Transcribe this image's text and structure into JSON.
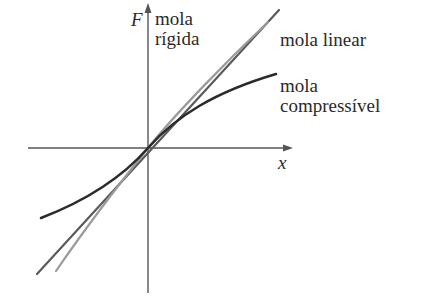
{
  "diagram": {
    "type": "force-vs-displacement",
    "axes": {
      "y_label": "F",
      "x_label": "x"
    },
    "curves": [
      {
        "id": "rigid",
        "label_line1": "mola",
        "label_line2": "rígida",
        "color": "#8c8c8c",
        "shape": "stiffening (cubic-like)"
      },
      {
        "id": "linear",
        "label": "mola linear",
        "color": "#555555",
        "shape": "straight line through origin"
      },
      {
        "id": "compressible",
        "label_line1": "mola",
        "label_line2": "compressível",
        "color": "#2b2b2b",
        "shape": "softening (saturating)"
      }
    ],
    "colors": {
      "axis": "#555555",
      "text": "#2a2a2a",
      "background": "#ffffff"
    }
  }
}
